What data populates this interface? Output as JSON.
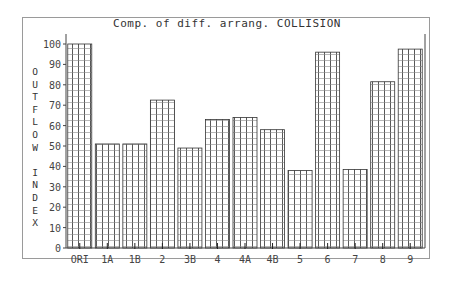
{
  "chart_data": {
    "type": "bar",
    "title": "Comp. of diff. arrang. COLLISION",
    "xlabel": "",
    "ylabel": "OUTFLOW INDEX",
    "ylabel_lines": [
      "O",
      "U",
      "T",
      "F",
      "L",
      "O",
      "W",
      "",
      "I",
      "N",
      "D",
      "E",
      "X"
    ],
    "categories": [
      "ORI",
      "1A",
      "1B",
      "2",
      "3B",
      "4",
      "4A",
      "4B",
      "5",
      "6",
      "7",
      "8",
      "9"
    ],
    "values": [
      100,
      51,
      51,
      72.5,
      49,
      63,
      64,
      58,
      38,
      96,
      38.5,
      81.5,
      97.5
    ],
    "ylim": [
      0,
      100
    ],
    "yticks": [
      0,
      10,
      20,
      30,
      40,
      50,
      60,
      70,
      80,
      90,
      100
    ],
    "grid": false,
    "bar_pattern": "cross-hatch",
    "colors": {
      "bar_line": "#333333",
      "axis": "#444444",
      "frame": "#9a9a9a"
    }
  }
}
